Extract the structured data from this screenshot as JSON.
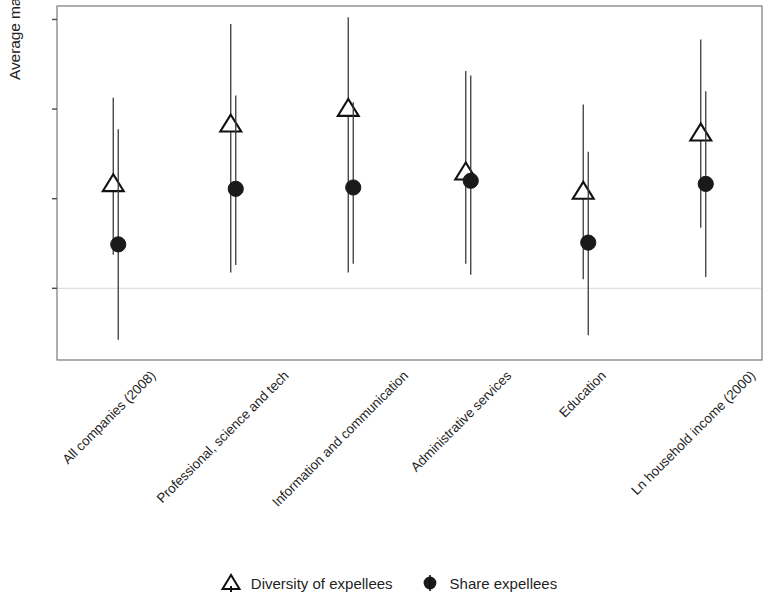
{
  "chart_data": {
    "type": "scatter",
    "title": "",
    "xlabel": "",
    "ylabel": "Average marginal effect",
    "ylim": [
      -0.16,
      0.63
    ],
    "yticks": [
      0.0,
      0.2,
      0.4,
      0.6
    ],
    "ytick_labels": [
      "0.0",
      "0.2",
      "0.4",
      "0.6"
    ],
    "grid": false,
    "zero_reference_line": 0.0,
    "legend_position": "bottom",
    "categories": [
      "All companies (2008)",
      "Professional, science and tech",
      "Information and communication",
      "Administrative services",
      "Education",
      "Ln household income (2000)"
    ],
    "series": [
      {
        "name": "Diversity of expellees",
        "marker": "triangle-open",
        "color": "#1a1a1a",
        "values": [
          0.232,
          0.365,
          0.4,
          0.258,
          0.215,
          0.345
        ],
        "ci_low": [
          0.075,
          0.035,
          0.035,
          0.055,
          0.02,
          0.135
        ],
        "ci_high": [
          0.425,
          0.59,
          0.605,
          0.485,
          0.41,
          0.555
        ]
      },
      {
        "name": "Share expellees",
        "marker": "circle-filled",
        "color": "#1a1a1a",
        "values": [
          0.098,
          0.222,
          0.225,
          0.24,
          0.102,
          0.233
        ],
        "ci_low": [
          -0.115,
          0.052,
          0.055,
          0.03,
          -0.105,
          0.025
        ],
        "ci_high": [
          0.355,
          0.43,
          0.415,
          0.475,
          0.305,
          0.44
        ]
      }
    ]
  },
  "legend": {
    "entries": [
      {
        "label": "Diversity of expellees",
        "icon": "triangle-open-marker"
      },
      {
        "label": "Share expellees",
        "icon": "circle-filled-marker"
      }
    ]
  },
  "axes": {
    "y_title": "Average marginal effect"
  }
}
